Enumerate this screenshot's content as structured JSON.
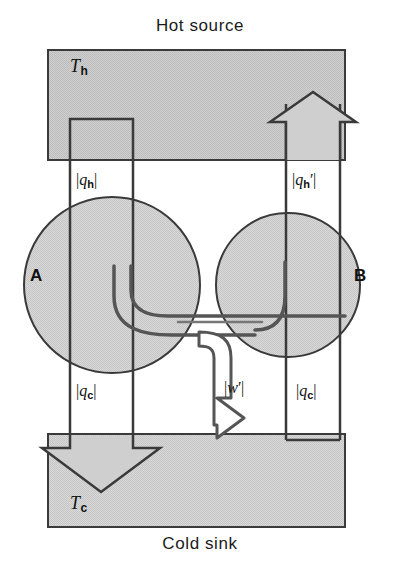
{
  "figure": {
    "title_top": "Hot source",
    "title_bottom": "Cold sink",
    "reservoirs": {
      "hot": {
        "temperature_label": "T",
        "temperature_subscript": "h",
        "name": "hot-source-block"
      },
      "cold": {
        "temperature_label": "T",
        "temperature_subscript": "c",
        "name": "cold-sink-block"
      }
    },
    "engines": [
      {
        "id": "A",
        "label": "A",
        "role": "engine"
      },
      {
        "id": "B",
        "label": "B",
        "role": "refrigerator"
      }
    ],
    "flows": [
      {
        "id": "qh",
        "symbol": "q",
        "subscript": "h",
        "prime": false,
        "text": "|q_h|",
        "from": "hot-source",
        "to": "engine-a",
        "direction": "down"
      },
      {
        "id": "qhp",
        "symbol": "q",
        "subscript": "h",
        "prime": true,
        "text": "|q_h'|",
        "from": "engine-b",
        "to": "hot-source",
        "direction": "up"
      },
      {
        "id": "qc",
        "symbol": "q",
        "subscript": "c",
        "prime": false,
        "text": "|q_c|",
        "from": "engine-a",
        "to": "cold-sink",
        "direction": "down"
      },
      {
        "id": "qcp",
        "symbol": "q",
        "subscript": "c",
        "prime": false,
        "text": "|q_c|",
        "from": "cold-sink",
        "to": "engine-b",
        "direction": "up"
      },
      {
        "id": "w",
        "symbol": "w",
        "subscript": "",
        "prime": true,
        "text": "|w'|",
        "from": "engine-a",
        "to": "engine-b",
        "direction": "right"
      }
    ],
    "colors": {
      "block_fill": "#c9c9c9",
      "circle_fill": "#d4d4d4",
      "stroke": "#3a3a3a",
      "text": "#111111",
      "background": "#ffffff"
    }
  }
}
